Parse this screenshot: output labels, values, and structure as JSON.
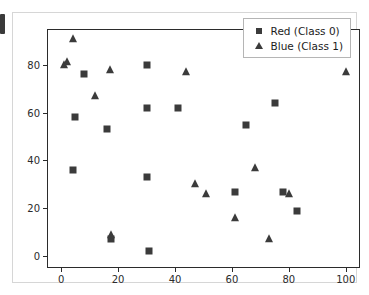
{
  "chart_data": {
    "type": "scatter",
    "title": "",
    "xlabel": "",
    "ylabel": "",
    "xlim": [
      -5,
      105
    ],
    "ylim": [
      -5,
      95
    ],
    "grid": false,
    "legend_position": "upper right",
    "xticks": [
      0,
      20,
      40,
      60,
      80,
      100
    ],
    "yticks": [
      0,
      20,
      40,
      60,
      80
    ],
    "xticklabels": [
      "0",
      "20",
      "40",
      "60",
      "80",
      "100"
    ],
    "yticklabels": [
      "0",
      "20",
      "40",
      "60",
      "80"
    ],
    "marker_color": "#3b3b3b",
    "series": [
      {
        "name": "Red (Class 0)",
        "marker": "square",
        "color": "#3b3b3b",
        "points": [
          [
            4,
            36
          ],
          [
            5,
            58
          ],
          [
            8,
            76
          ],
          [
            16,
            53
          ],
          [
            17.5,
            7
          ],
          [
            30,
            33
          ],
          [
            30,
            80
          ],
          [
            30,
            62
          ],
          [
            31,
            2
          ],
          [
            41,
            62
          ],
          [
            61,
            27
          ],
          [
            65,
            55
          ],
          [
            75,
            64
          ],
          [
            78,
            27
          ],
          [
            83,
            19
          ]
        ]
      },
      {
        "name": "Blue (Class 1)",
        "marker": "triangle",
        "color": "#3b3b3b",
        "points": [
          [
            1,
            80
          ],
          [
            2,
            81
          ],
          [
            4,
            91
          ],
          [
            12,
            67
          ],
          [
            17,
            78
          ],
          [
            17.5,
            9
          ],
          [
            44,
            77
          ],
          [
            47,
            30
          ],
          [
            51,
            26
          ],
          [
            61,
            16
          ],
          [
            68,
            37
          ],
          [
            73,
            7
          ],
          [
            80,
            26
          ],
          [
            100,
            77
          ]
        ]
      }
    ]
  },
  "legend": {
    "entries": [
      {
        "label": "Red (Class 0)",
        "marker": "square-marker-icon"
      },
      {
        "label": "Blue (Class 1)",
        "marker": "triangle-marker-icon"
      }
    ]
  }
}
